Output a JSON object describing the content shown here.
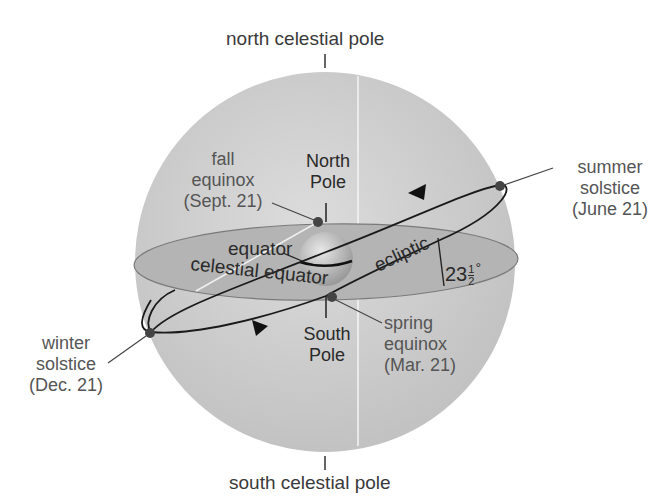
{
  "labels": {
    "north_celestial_pole": "north celestial pole",
    "south_celestial_pole": "south celestial pole",
    "north_pole": [
      "North",
      "Pole"
    ],
    "south_pole": [
      "South",
      "Pole"
    ],
    "fall_equinox": [
      "fall",
      "equinox",
      "(Sept. 21)"
    ],
    "spring_equinox": [
      "spring",
      "equinox",
      "(Mar. 21)"
    ],
    "summer_solstice": [
      "summer",
      "solstice",
      "(June 21)"
    ],
    "winter_solstice": [
      "winter",
      "solstice",
      "(Dec. 21)"
    ],
    "equator": "equator",
    "celestial_equator": "celestial equator",
    "ecliptic": "ecliptic",
    "tilt_whole": "23",
    "tilt_num": "1",
    "tilt_den": "2",
    "tilt_deg": "°"
  },
  "colors": {
    "sphere": "#c8c8c8",
    "equator_plane": "#b0b0b0",
    "line": "#222222",
    "text": "#3a3a3a"
  }
}
